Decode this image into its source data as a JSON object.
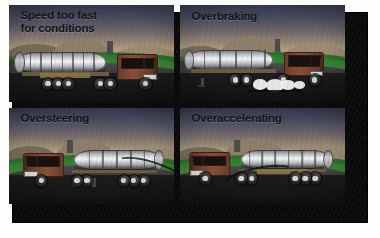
{
  "figure": {
    "name": "truck-rollover-causes-illustration",
    "frame_color": "#090909",
    "page_background": "#fdfdfb",
    "panel_count": 4,
    "layout": "2x2-grid"
  },
  "panels": [
    {
      "id": "speed-too-fast",
      "caption": "Speed too fast\nfor conditions",
      "caption_lines": 2,
      "truck_direction": "right",
      "scene": {
        "sky": "dusk-gradient",
        "hills": "brown",
        "field": "green",
        "road": "dark-asphalt-curve"
      }
    },
    {
      "id": "overbraking",
      "caption": "Overbraking",
      "caption_lines": 1,
      "truck_direction": "right",
      "scene": {
        "sky": "dusk-gradient",
        "hills": "brown",
        "field": "green",
        "road": "dark-asphalt-curve",
        "effect": "brake-smoke"
      }
    },
    {
      "id": "oversteering",
      "caption": "Oversteering",
      "caption_lines": 1,
      "truck_direction": "left",
      "scene": {
        "sky": "dusk-gradient",
        "hills": "brown",
        "field": "green",
        "road": "dark-asphalt-curve",
        "effect": "swerve-arc"
      }
    },
    {
      "id": "overaccelerating",
      "caption": "Overaccelerating",
      "caption_lines": 1,
      "truck_direction": "left",
      "scene": {
        "sky": "dusk-gradient",
        "hills": "brown",
        "field": "green",
        "road": "dark-asphalt-curve",
        "effect": "swerve-arc"
      }
    }
  ],
  "colors": {
    "sky_top": "#3a4157",
    "sky_horizon": "#e6dcb6",
    "hill": "#8e7f6b",
    "grass": "#3f8c34",
    "road": "#2a2a2a",
    "tank_metal": "#e2e3e6",
    "cab_body": "#8a5038",
    "caption_text": "#11131d",
    "frame": "#090909"
  }
}
